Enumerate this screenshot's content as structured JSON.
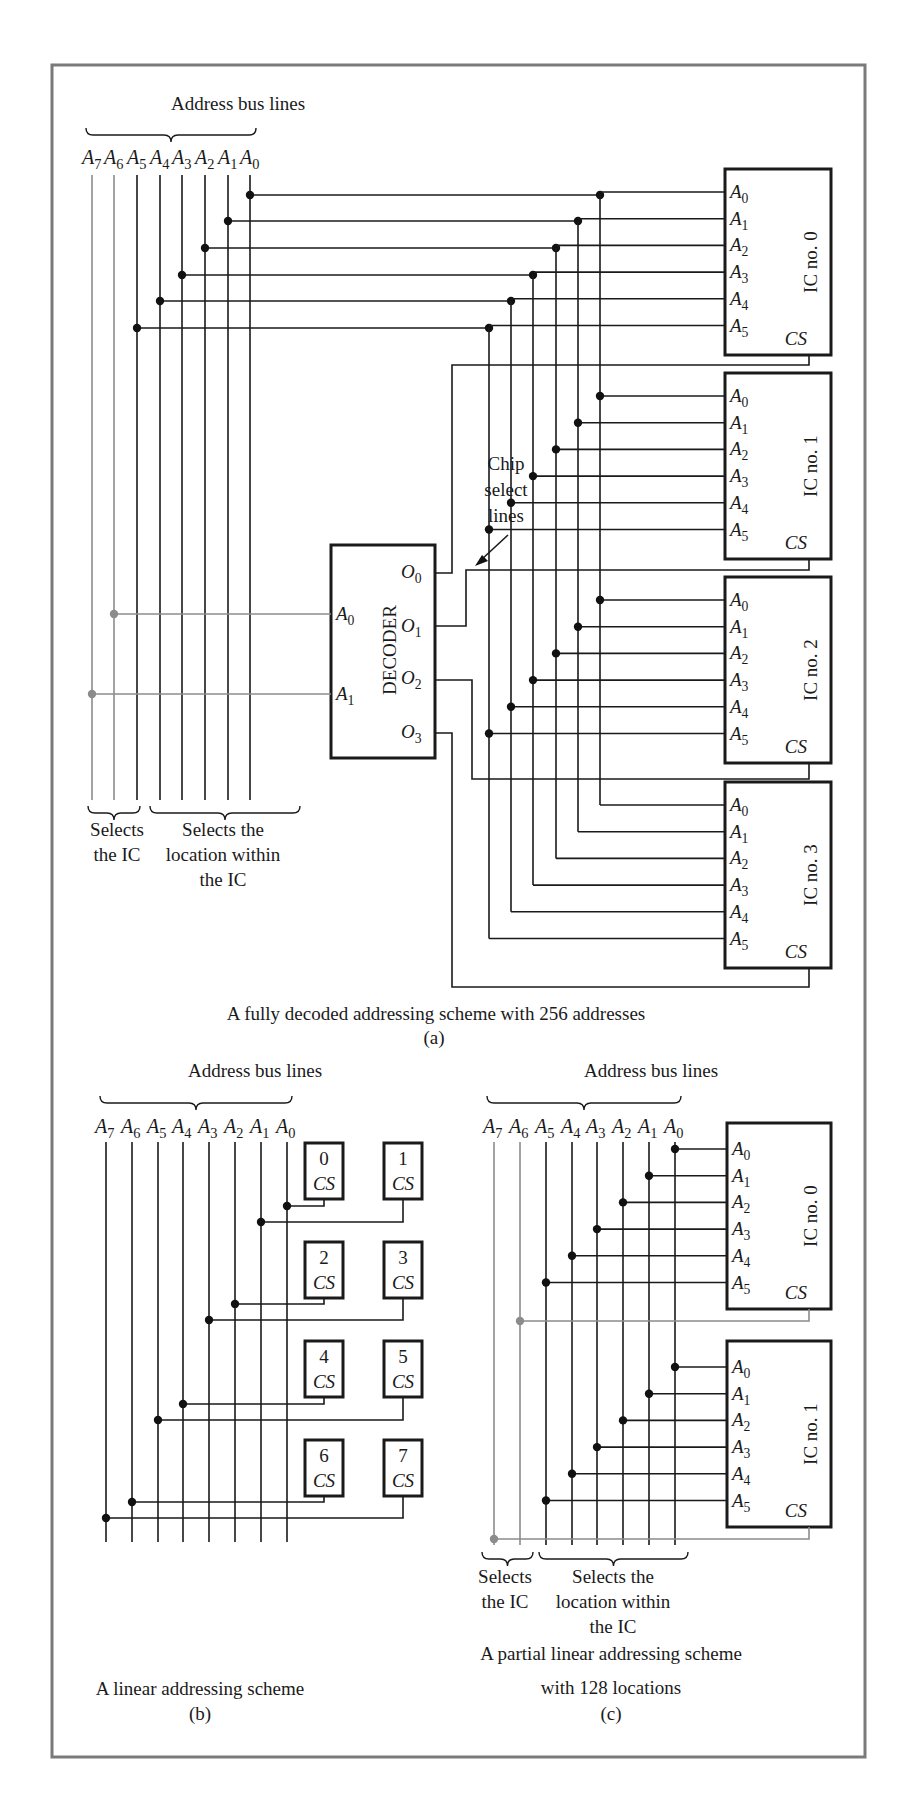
{
  "figure": {
    "part_a": {
      "bus_label": "Address bus lines",
      "lines": [
        "A7",
        "A6",
        "A5",
        "A4",
        "A3",
        "A2",
        "A1",
        "A0"
      ],
      "decoder": {
        "title": "DECODER",
        "inputs": [
          "A0",
          "A1"
        ],
        "outputs": [
          "O0",
          "O1",
          "O2",
          "O3"
        ]
      },
      "chip_select_note": [
        "Chip",
        "select",
        "lines"
      ],
      "ics": [
        {
          "name": "IC no. 0",
          "pins": [
            "A0",
            "A1",
            "A2",
            "A3",
            "A4",
            "A5"
          ],
          "cs": "CS"
        },
        {
          "name": "IC no. 1",
          "pins": [
            "A0",
            "A1",
            "A2",
            "A3",
            "A4",
            "A5"
          ],
          "cs": "CS"
        },
        {
          "name": "IC no. 2",
          "pins": [
            "A0",
            "A1",
            "A2",
            "A3",
            "A4",
            "A5"
          ],
          "cs": "CS"
        },
        {
          "name": "IC no. 3",
          "pins": [
            "A0",
            "A1",
            "A2",
            "A3",
            "A4",
            "A5"
          ],
          "cs": "CS"
        }
      ],
      "note_left": [
        "Selects",
        "the IC"
      ],
      "note_right": [
        "Selects the",
        "location within",
        "the IC"
      ],
      "caption": "A fully decoded addressing scheme with 256 addresses",
      "label": "(a)"
    },
    "part_b": {
      "bus_label": "Address bus lines",
      "lines": [
        "A7",
        "A6",
        "A5",
        "A4",
        "A3",
        "A2",
        "A1",
        "A0"
      ],
      "chips": [
        {
          "num": "0",
          "cs": "CS"
        },
        {
          "num": "1",
          "cs": "CS"
        },
        {
          "num": "2",
          "cs": "CS"
        },
        {
          "num": "3",
          "cs": "CS"
        },
        {
          "num": "4",
          "cs": "CS"
        },
        {
          "num": "5",
          "cs": "CS"
        },
        {
          "num": "6",
          "cs": "CS"
        },
        {
          "num": "7",
          "cs": "CS"
        }
      ],
      "caption": "A linear addressing scheme",
      "label": "(b)"
    },
    "part_c": {
      "bus_label": "Address bus lines",
      "lines": [
        "A7",
        "A6",
        "A5",
        "A4",
        "A3",
        "A2",
        "A1",
        "A0"
      ],
      "ics": [
        {
          "name": "IC no. 0",
          "pins": [
            "A0",
            "A1",
            "A2",
            "A3",
            "A4",
            "A5"
          ],
          "cs": "CS"
        },
        {
          "name": "IC no. 1",
          "pins": [
            "A0",
            "A1",
            "A2",
            "A3",
            "A4",
            "A5"
          ],
          "cs": "CS"
        }
      ],
      "note_left": [
        "Selects",
        "the IC"
      ],
      "note_right": [
        "Selects the",
        "location within",
        "the IC"
      ],
      "caption": [
        "A partial linear addressing scheme",
        "with 128 locations"
      ],
      "label": "(c)"
    }
  },
  "colors": {
    "ink": "#1a1a1a",
    "frame": "#7a7a7a",
    "ic_select_wire": "#8c8c8c",
    "background": "#ffffff"
  }
}
